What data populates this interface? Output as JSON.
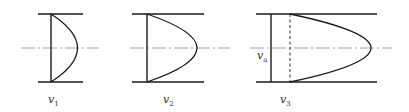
{
  "figure": {
    "panels": [
      {
        "id": "v1",
        "label_main": "v",
        "label_sub": "1",
        "profile": "parabolic-small"
      },
      {
        "id": "v2",
        "label_main": "v",
        "label_sub": "2",
        "profile": "parabolic-medium"
      },
      {
        "id": "v3",
        "label_main": "v",
        "label_sub": "3",
        "profile": "parabolic-large-with-mean",
        "mean_label_main": "v",
        "mean_label_sub": "a"
      }
    ],
    "colors": {
      "line": "#1a1a1a",
      "centerline": "#8a8a8a",
      "text": "#333333"
    }
  }
}
